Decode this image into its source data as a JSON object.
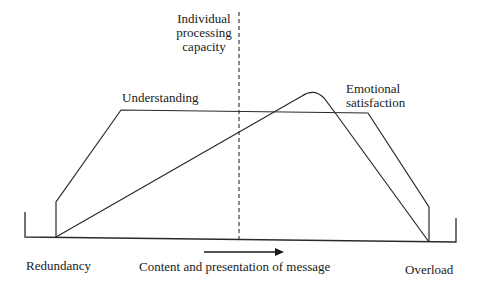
{
  "diagram": {
    "labels": {
      "capacity_line1": "Individual",
      "capacity_line2": "processing",
      "capacity_line3": "capacity",
      "understanding": "Understanding",
      "emotional_line1": "Emotional",
      "emotional_line2": "satisfaction",
      "left_axis": "Redundancy",
      "axis_title": "Content and presentation of message",
      "right_axis": "Overload"
    },
    "colors": {
      "stroke": "#2a2a2a",
      "text": "#1a1a1a",
      "background": "#ffffff"
    }
  }
}
